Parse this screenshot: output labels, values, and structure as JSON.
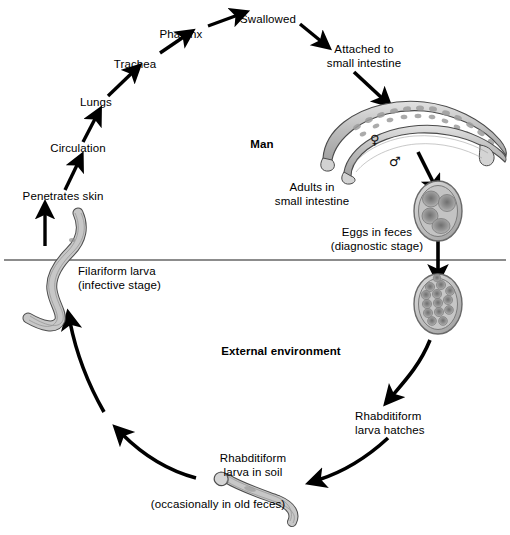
{
  "figure": {
    "soil_line_label": "soil surface line",
    "colors": {
      "ink": "#000000",
      "worm_fill": "#c9c9c9",
      "worm_stroke": "#4a4a4a",
      "egg_fill": "#b8b8b8",
      "egg_cell": "#8a8a8a",
      "background": "#ffffff"
    }
  },
  "host_section": {
    "title": "Man",
    "steps": [
      {
        "id": "penetrates-skin",
        "label": "Penetrates skin"
      },
      {
        "id": "circulation",
        "label": "Circulation"
      },
      {
        "id": "lungs",
        "label": "Lungs"
      },
      {
        "id": "trachea",
        "label": "Trachea"
      },
      {
        "id": "pharynx",
        "label": "Pharynx"
      },
      {
        "id": "swallowed",
        "label": "Swallowed"
      }
    ],
    "attached_line1": "Attached to",
    "attached_line2": "small intestine",
    "adults_line1": "Adults in",
    "adults_line2": "small intestine",
    "female_symbol": "♀",
    "male_symbol": "♂",
    "female_name": "female adult worm",
    "male_name": "male adult worm"
  },
  "environment_section": {
    "title": "External environment",
    "eggs_line1": "Eggs in feces",
    "eggs_line2": "(diagnostic stage)",
    "hatch_line1": "Rhabditiform",
    "hatch_line2": "larva hatches",
    "soil_larva_line1": "Rhabditiform",
    "soil_larva_line2": "larva in soil",
    "soil_larva_note": "(occasionally in old feces)",
    "filariform_line1": "Filariform larva",
    "filariform_line2": "(infective stage)"
  }
}
